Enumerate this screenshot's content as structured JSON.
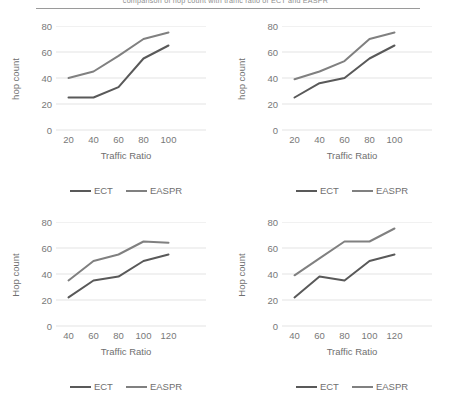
{
  "page": {
    "caption_cropped": "comparison of hop count with traffic ratio of ECT and EASPR"
  },
  "colors": {
    "ect_line": "#595959",
    "easpr_line": "#808080",
    "gridline": "#e3e3e3",
    "text": "#6f6f6f",
    "tick_text": "#787878",
    "rule": "#9a9a9a"
  },
  "legend": {
    "entries": [
      {
        "label": "ECT",
        "color": "#595959"
      },
      {
        "label": "EASPR",
        "color": "#808080"
      }
    ]
  },
  "chart_data": [
    {
      "id": "chart-top-left",
      "type": "line",
      "title": "",
      "xlabel": "Traffic Ratio",
      "ylabel": "hop count",
      "x": [
        20,
        40,
        60,
        80,
        100
      ],
      "categories": [
        "20",
        "40",
        "60",
        "80",
        "100"
      ],
      "yticks": [
        0,
        20,
        40,
        60,
        80
      ],
      "ylim": [
        0,
        80
      ],
      "xlim": [
        10,
        130
      ],
      "grid": true,
      "legend_position": "bottom",
      "series": [
        {
          "name": "ECT",
          "color": "#595959",
          "values": [
            25,
            25,
            33,
            55,
            65
          ]
        },
        {
          "name": "EASPR",
          "color": "#808080",
          "values": [
            40,
            45,
            57,
            70,
            75
          ]
        }
      ]
    },
    {
      "id": "chart-top-right",
      "type": "line",
      "title": "",
      "xlabel": "Traffic Ratio",
      "ylabel": "hop count",
      "x": [
        20,
        40,
        60,
        80,
        100
      ],
      "categories": [
        "20",
        "40",
        "60",
        "80",
        "100"
      ],
      "yticks": [
        0,
        20,
        40,
        60,
        80
      ],
      "ylim": [
        0,
        80
      ],
      "xlim": [
        10,
        130
      ],
      "grid": true,
      "legend_position": "bottom",
      "series": [
        {
          "name": "ECT",
          "color": "#595959",
          "values": [
            25,
            36,
            40,
            55,
            65
          ]
        },
        {
          "name": "EASPR",
          "color": "#808080",
          "values": [
            39,
            45,
            53,
            70,
            75
          ]
        }
      ]
    },
    {
      "id": "chart-bottom-left",
      "type": "line",
      "title": "",
      "xlabel": "Traffic Ratio",
      "ylabel": "Hop count",
      "x": [
        40,
        60,
        80,
        100,
        120
      ],
      "categories": [
        "40",
        "60",
        "80",
        "100",
        "120"
      ],
      "yticks": [
        0,
        20,
        40,
        60,
        80
      ],
      "ylim": [
        0,
        80
      ],
      "xlim": [
        30,
        150
      ],
      "grid": true,
      "legend_position": "bottom",
      "series": [
        {
          "name": "ECT",
          "color": "#595959",
          "values": [
            22,
            35,
            38,
            50,
            55
          ]
        },
        {
          "name": "EASPR",
          "color": "#808080",
          "values": [
            35,
            50,
            55,
            65,
            64
          ]
        }
      ]
    },
    {
      "id": "chart-bottom-right",
      "type": "line",
      "title": "",
      "xlabel": "Traffic Ratio",
      "ylabel": "Hop count",
      "x": [
        40,
        60,
        80,
        100,
        120
      ],
      "categories": [
        "40",
        "60",
        "80",
        "100",
        "120"
      ],
      "yticks": [
        0,
        20,
        40,
        60,
        80
      ],
      "ylim": [
        0,
        80
      ],
      "xlim": [
        30,
        150
      ],
      "grid": true,
      "legend_position": "bottom",
      "series": [
        {
          "name": "ECT",
          "color": "#595959",
          "values": [
            22,
            38,
            35,
            50,
            55
          ]
        },
        {
          "name": "EASPR",
          "color": "#808080",
          "values": [
            39,
            52,
            65,
            65,
            75
          ]
        }
      ]
    }
  ]
}
